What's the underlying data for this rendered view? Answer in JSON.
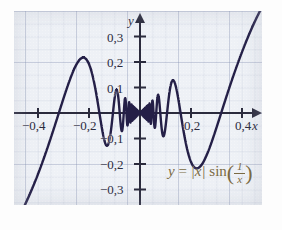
{
  "figure": {
    "kind": "math-function-plot",
    "paper": "graph-paper",
    "formula_text": "y = |x| sin(1/x)",
    "formula_parts": {
      "y": "y",
      "equals": "=",
      "abs_x": "|x|",
      "sin": "sin",
      "numerator": "1",
      "denominator": "x"
    },
    "axis_names": {
      "x": "x",
      "y": "y"
    },
    "colors": {
      "curve": "#241f47",
      "formula": "#7a6a43",
      "axis": "#2b2b3d",
      "grid_major": "#7887aa",
      "grid_minor": "#9aa6c4",
      "paper": "#eef1f6",
      "page": "#fdfdfd"
    }
  },
  "chart_data": {
    "type": "line",
    "title": "",
    "subtitle": "",
    "xlabel": "x",
    "ylabel": "y",
    "expression": "y = |x| sin(1/x)",
    "grid": true,
    "legend": "none",
    "annotations": [
      "y = |x| sin(1/x)"
    ],
    "xlim": [
      -0.5,
      0.47
    ],
    "ylim": [
      -0.33,
      0.35
    ],
    "xticks": [
      -0.4,
      -0.2,
      0.2,
      0.4
    ],
    "xtick_labels": [
      "−0,4",
      "−0,2",
      "0,2",
      "0,4"
    ],
    "yticks": [
      -0.3,
      -0.2,
      -0.1,
      0.1,
      0.2,
      0.3
    ],
    "ytick_labels": [
      "−0,3",
      "−0,2",
      "−0,1",
      "0,1",
      "0,2",
      "0,3"
    ],
    "origin": [
      0,
      0
    ],
    "features": {
      "envelope_upper": "y = |x|",
      "envelope_lower": "y = -|x|",
      "oscillation": "infinite near x = 0",
      "left_max": {
        "x": -0.222,
        "y": 0.221
      },
      "right_min": {
        "x": 0.222,
        "y": -0.221
      },
      "local_max_near_right": {
        "x": 0.134,
        "y": 0.13
      },
      "local_min_near_left": {
        "x": -0.134,
        "y": -0.13
      }
    },
    "series": [
      {
        "name": "y = |x| sin(1/x)",
        "color": "#241f47",
        "samples": "computed: y = abs(x)*sin(1/x) over x in [-0.5, 0.47]"
      }
    ]
  },
  "labels": {
    "x_neg_04": "−0,4",
    "x_neg_02": "−0,2",
    "x_pos_02": "0,2",
    "x_pos_04": "0,4",
    "y_pos_01": "0,1",
    "y_pos_02": "0,2",
    "y_pos_03": "0,3",
    "y_neg_01": "−0,1",
    "y_neg_02": "−0,2",
    "y_neg_03": "−0,3"
  }
}
